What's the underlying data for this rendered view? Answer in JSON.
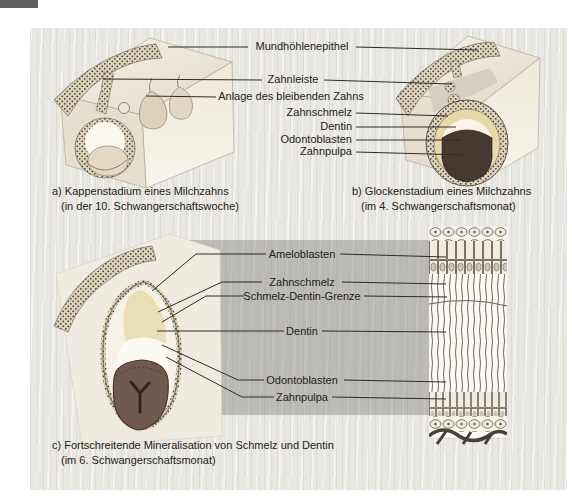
{
  "figure": {
    "labels_top": [
      {
        "id": "mundhoehlenepithel",
        "text": "Mundhöhlenepithel"
      },
      {
        "id": "zahnleiste",
        "text": "Zahnleiste"
      },
      {
        "id": "anlage_bleibender_zahn",
        "text": "Anlage des bleibenden Zahns"
      },
      {
        "id": "zahnschmelz",
        "text": "Zahnschmelz"
      },
      {
        "id": "dentin",
        "text": "Dentin"
      },
      {
        "id": "odontoblasten",
        "text": "Odontoblasten"
      },
      {
        "id": "zahnpulpa",
        "text": "Zahnpulpa"
      }
    ],
    "labels_bottom": [
      {
        "id": "ameloblasten",
        "text": "Ameloblasten"
      },
      {
        "id": "zahnschmelz",
        "text": "Zahnschmelz"
      },
      {
        "id": "schmelz_dentin_grenze",
        "text": "Schmelz-Dentin-Grenze"
      },
      {
        "id": "dentin",
        "text": "Dentin"
      },
      {
        "id": "odontoblasten",
        "text": "Odontoblasten"
      },
      {
        "id": "zahnpulpa",
        "text": "Zahnpulpa"
      }
    ],
    "captions": {
      "a": {
        "line1": "a) Kappenstadium eines Milchzahns",
        "line2": "(in der 10. Schwangerschaftswoche)"
      },
      "b": {
        "line1": "b) Glockenstadium eines Milchzahns",
        "line2": "(im 4. Schwangerschaftsmonat)"
      },
      "c": {
        "line1": "c) Fortschreitende Mineralisation von Schmelz und Dentin",
        "line2": "(im 6. Schwangerschaftsmonat)"
      }
    },
    "colors": {
      "panel_bg": "#e9e7e2",
      "callout_band": "#7d7b76",
      "leader_line": "#2e2c29",
      "text": "#1e1d1b",
      "corner_tab": "#616161",
      "block_cream": "#f1ecdf",
      "epithelium_tissue": "#ddd3b9",
      "enamel_yellow": "#e7d8a8",
      "pulp_dark": "#473931",
      "pulp_brown": "#6f5a4d"
    }
  }
}
